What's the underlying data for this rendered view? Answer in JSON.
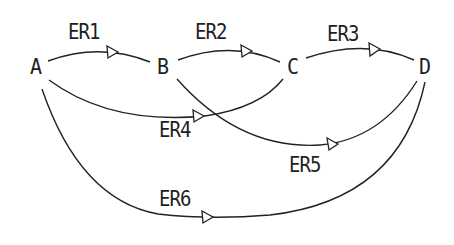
{
  "diagram": {
    "type": "directed-graph",
    "line_color": "#222222",
    "background": "#ffffff",
    "nodes": [
      {
        "id": "A",
        "label": "A"
      },
      {
        "id": "B",
        "label": "B"
      },
      {
        "id": "C",
        "label": "C"
      },
      {
        "id": "D",
        "label": "D"
      }
    ],
    "edges": [
      {
        "id": "ER1",
        "label": "ER1",
        "from": "A",
        "to": "B"
      },
      {
        "id": "ER2",
        "label": "ER2",
        "from": "B",
        "to": "C"
      },
      {
        "id": "ER3",
        "label": "ER3",
        "from": "C",
        "to": "D"
      },
      {
        "id": "ER4",
        "label": "ER4",
        "from": "A",
        "to": "C"
      },
      {
        "id": "ER5",
        "label": "ER5",
        "from": "B",
        "to": "D"
      },
      {
        "id": "ER6",
        "label": "ER6",
        "from": "A",
        "to": "D"
      }
    ]
  }
}
